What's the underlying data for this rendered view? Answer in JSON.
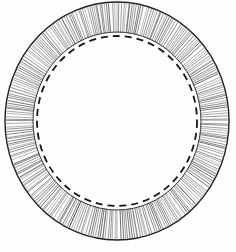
{
  "figure": {
    "kind": "technical-line-drawing",
    "medium": "engraved-halftone-scan",
    "background_color": "#ffffff",
    "ink_color": "#1a1a1a",
    "hatch_color": "#4a4a4a",
    "canvas": {
      "width": 236,
      "height": 252
    }
  },
  "geometry": {
    "center": {
      "cx": 117,
      "cy": 121
    },
    "outer_circle": {
      "name": "outer-boundary",
      "rx": 112,
      "ry": 119,
      "stroke": "#202020",
      "stroke_width": 1.4,
      "dash": "none"
    },
    "inner_circle": {
      "name": "inner-boundary",
      "rx": 84,
      "ry": 89,
      "stroke": "#3a3a3a",
      "stroke_width": 1.0,
      "dash": "none"
    },
    "dashed_circle": {
      "name": "dashed-reference-circle",
      "rx": 80,
      "ry": 85,
      "stroke": "#141414",
      "stroke_width": 1.8,
      "dash": "7 5"
    },
    "hatching": {
      "name": "radial-hatch-band",
      "line_count": 300,
      "stroke": "#555555",
      "stroke_width": 0.55,
      "inner_rx": 85,
      "inner_ry": 90,
      "outer_rx": 111,
      "outer_ry": 118
    }
  },
  "labels": {
    "caption": "",
    "annotations": []
  }
}
